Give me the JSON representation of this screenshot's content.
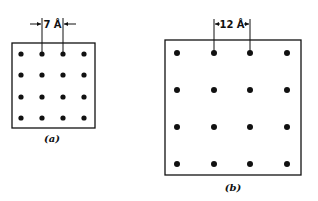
{
  "panels": [
    {
      "id": "a",
      "caption": "(a)",
      "spacing_label": "7 Å",
      "grid": {
        "rows": 4,
        "cols": 4
      },
      "box": {
        "x": 12,
        "y": 43,
        "w": 83,
        "h": 85
      },
      "dot_x": [
        21,
        42,
        63,
        84
      ],
      "dot_y": [
        54,
        75,
        97,
        118
      ]
    },
    {
      "id": "b",
      "caption": "(b)",
      "spacing_label": "12 Å",
      "grid": {
        "rows": 4,
        "cols": 4
      },
      "box": {
        "x": 165,
        "y": 40,
        "w": 136,
        "h": 135
      },
      "dot_x": [
        177,
        214,
        250,
        287
      ],
      "dot_y": [
        53,
        90,
        127,
        164
      ]
    }
  ],
  "colors": {
    "ink": "#111111",
    "background": "#ffffff"
  }
}
